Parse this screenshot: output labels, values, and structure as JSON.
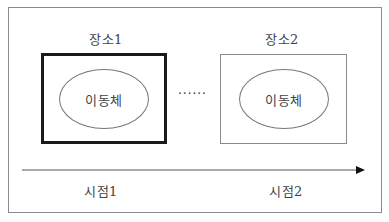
{
  "diagram": {
    "places": [
      {
        "label": "장소1",
        "entity": "이동체",
        "border": "thick"
      },
      {
        "label": "장소2",
        "entity": "이동체",
        "border": "thin"
      }
    ],
    "ellipsis": "······",
    "time_axis": {
      "points": [
        {
          "label": "시점1"
        },
        {
          "label": "시점2"
        }
      ],
      "direction": "right"
    }
  }
}
